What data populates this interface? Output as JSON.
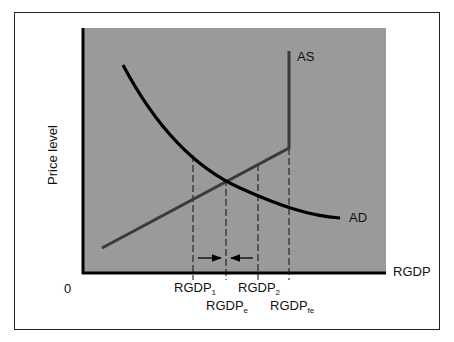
{
  "diagram": {
    "type": "AD-AS model",
    "y_axis_label": "Price level",
    "x_axis_label": "RGDP",
    "origin_label": "0",
    "curves": {
      "as": {
        "label": "AS",
        "color": "#3a3a3a"
      },
      "ad": {
        "label": "AD",
        "color": "#000000"
      }
    },
    "x_ticks": [
      {
        "base": "RGDP",
        "sub": "1"
      },
      {
        "base": "RGDP",
        "sub": "e"
      },
      {
        "base": "RGDP",
        "sub": "2"
      },
      {
        "base": "RGDP",
        "sub": "fe"
      }
    ],
    "arrows": [
      {
        "from": "RGDP1",
        "to": "RGDPe",
        "direction": "right"
      },
      {
        "from": "RGDP2",
        "to": "RGDPe",
        "direction": "left"
      }
    ],
    "colors": {
      "plot_background": "#9a9a9a",
      "axis": "#000000",
      "frame": "#222222"
    }
  }
}
